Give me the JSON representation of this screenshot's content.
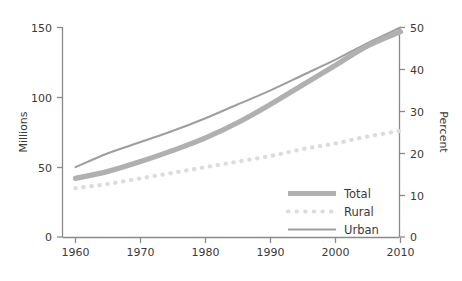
{
  "chart_data": {
    "type": "line",
    "title": "",
    "xlabel": "",
    "ylabel": "Millions",
    "y2label": "Percent",
    "xlim": [
      1960,
      2010
    ],
    "ylim": [
      0,
      155
    ],
    "y2lim": [
      0,
      51.6667
    ],
    "grid": false,
    "legend_position": "bottom-right",
    "x": [
      1960,
      1965,
      1970,
      1975,
      1980,
      1985,
      1990,
      1995,
      2000,
      2005,
      2010
    ],
    "xticks": [
      "1960",
      "1970",
      "1980",
      "1990",
      "2000",
      "2010"
    ],
    "yticks": [
      "0",
      "50",
      "100",
      "150"
    ],
    "y2ticks": [
      "0",
      "10",
      "20",
      "30",
      "40",
      "50"
    ],
    "series": [
      {
        "name": "Total",
        "style": "thick-solid",
        "color": "#b0b0b0",
        "values": [
          42,
          47,
          54,
          62,
          71,
          82,
          95,
          109,
          123,
          137,
          147
        ]
      },
      {
        "name": "Rural",
        "style": "dotted",
        "color": "#dcdcdc",
        "values": [
          35,
          38,
          42,
          46,
          50,
          54,
          58,
          63,
          67,
          72,
          76
        ]
      },
      {
        "name": "Urban",
        "style": "thin-solid",
        "color": "#9e9e9e",
        "values": [
          50,
          60,
          68,
          76,
          85,
          95,
          105,
          116,
          127,
          139,
          150
        ]
      }
    ]
  },
  "legend": {
    "items": [
      {
        "label": "Total",
        "swatch": "thick-solid"
      },
      {
        "label": "Rural",
        "swatch": "dotted"
      },
      {
        "label": "Urban",
        "swatch": "thin-solid"
      }
    ]
  },
  "axes": {
    "left_title": "Millions",
    "right_title": "Percent"
  },
  "colors": {
    "axis": "#8a8a8a",
    "text": "#3a3a3a",
    "total": "#b0b0b0",
    "rural": "#dcdcdc",
    "urban": "#9e9e9e",
    "background": "#ffffff"
  }
}
